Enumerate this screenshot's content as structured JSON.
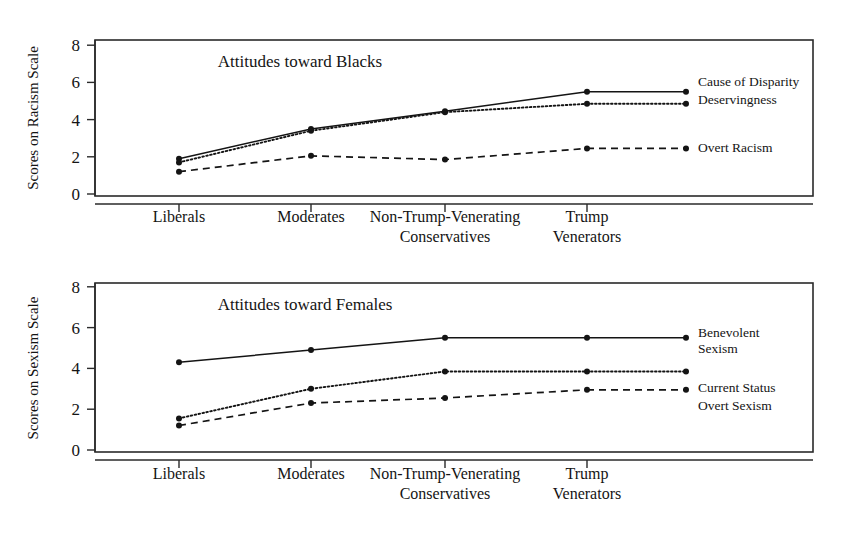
{
  "figure": {
    "width": 856,
    "height": 539,
    "background": "#ffffff",
    "ink_color": "#141414"
  },
  "chart_data": [
    {
      "type": "line",
      "id": "racism-panel",
      "title": "Attitudes toward Blacks",
      "xlabel": "",
      "ylabel": "Scores on Racism Scale",
      "categories": [
        "Liberals",
        "Moderates",
        "Non-Trump-Venerating Conservatives",
        "Trump Venerators"
      ],
      "category_labels_wrapped": [
        [
          "Liberals"
        ],
        [
          "Moderates"
        ],
        [
          "Non-Trump-Venerating",
          "Conservatives"
        ],
        [
          "Trump",
          "Venerators"
        ]
      ],
      "ylim": [
        0,
        8.6
      ],
      "yticks": [
        0,
        2,
        4,
        6,
        8
      ],
      "ytick_labels": [
        "0",
        "2",
        "4",
        "6",
        "8"
      ],
      "grid": false,
      "legend_position": "right-inline",
      "series": [
        {
          "name": "Cause of Disparity",
          "style": "solid",
          "values": [
            1.9,
            3.5,
            4.45,
            5.5
          ],
          "label_lines": [
            "Cause of Disparity"
          ]
        },
        {
          "name": "Deservingness",
          "style": "dotted",
          "values": [
            1.7,
            3.4,
            4.4,
            4.85
          ],
          "label_lines": [
            "Deservingness"
          ]
        },
        {
          "name": "Overt Racism",
          "style": "dashed",
          "values": [
            1.2,
            2.05,
            1.85,
            2.45
          ],
          "label_lines": [
            "Overt Racism"
          ]
        }
      ]
    },
    {
      "type": "line",
      "id": "sexism-panel",
      "title": "Attitudes toward Females",
      "xlabel": "",
      "ylabel": "Scores on Sexism Scale",
      "categories": [
        "Liberals",
        "Moderates",
        "Non-Trump-Venerating Conservatives",
        "Trump Venerators"
      ],
      "category_labels_wrapped": [
        [
          "Liberals"
        ],
        [
          "Moderates"
        ],
        [
          "Non-Trump-Venerating",
          "Conservatives"
        ],
        [
          "Trump",
          "Venerators"
        ]
      ],
      "ylim": [
        0,
        8.6
      ],
      "yticks": [
        0,
        2,
        4,
        6,
        8
      ],
      "ytick_labels": [
        "0",
        "2",
        "4",
        "6",
        "8"
      ],
      "grid": false,
      "legend_position": "right-inline",
      "series": [
        {
          "name": "Benevolent Sexism",
          "style": "solid",
          "values": [
            4.3,
            4.9,
            5.5,
            5.5
          ],
          "label_lines": [
            "Benevolent",
            "Sexism"
          ]
        },
        {
          "name": "Current Status",
          "style": "dotted",
          "values": [
            1.55,
            3.0,
            3.85,
            3.85
          ],
          "label_lines": [
            "Current Status"
          ]
        },
        {
          "name": "Overt Sexism",
          "style": "dashed",
          "values": [
            1.2,
            2.3,
            2.55,
            2.95
          ],
          "label_lines": [
            "Overt Sexism"
          ]
        }
      ]
    }
  ]
}
